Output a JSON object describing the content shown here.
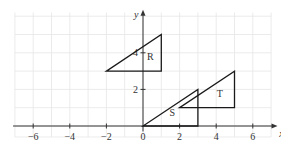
{
  "diagram": {
    "title": "",
    "x_axis": {
      "label": "x",
      "range": [
        -7,
        7
      ],
      "ticks": [
        -6,
        -4,
        -2,
        0,
        2,
        4,
        6
      ],
      "tick_labels": [
        "−6",
        "−4",
        "−2",
        "0",
        "2",
        "4",
        "6"
      ]
    },
    "y_axis": {
      "label": "y",
      "range": [
        0,
        6
      ],
      "ticks": [
        2,
        4
      ],
      "tick_labels": [
        "2",
        "4"
      ]
    },
    "grid": {
      "on": true,
      "step": 1,
      "color": "#e6e6e6"
    },
    "shapes": [
      {
        "name": "R",
        "vertices": [
          [
            -2,
            3
          ],
          [
            1,
            3
          ],
          [
            1,
            5
          ]
        ],
        "label_at": [
          0.4,
          3.6
        ]
      },
      {
        "name": "S",
        "vertices": [
          [
            0,
            0
          ],
          [
            3,
            0
          ],
          [
            3,
            2
          ]
        ],
        "label_at": [
          1.6,
          0.55
        ]
      },
      {
        "name": "T",
        "vertices": [
          [
            2,
            1
          ],
          [
            5,
            1
          ],
          [
            5,
            3
          ]
        ],
        "label_at": [
          4.2,
          1.6
        ]
      }
    ]
  }
}
